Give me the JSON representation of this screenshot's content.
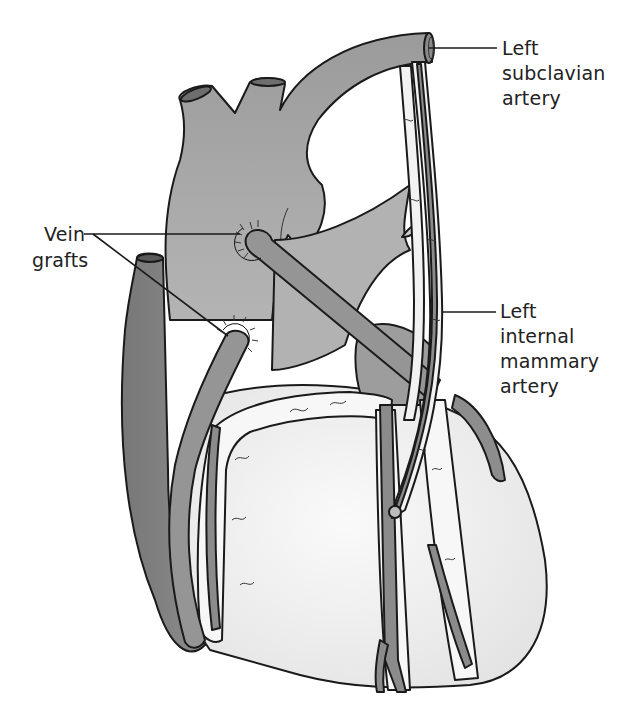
{
  "figure": {
    "labels": {
      "subclavian": [
        "Left",
        "subclavian",
        "artery"
      ],
      "vein_grafts": [
        "Vein",
        "grafts"
      ],
      "mammary": [
        "Left",
        "internal",
        "mammary",
        "artery"
      ]
    },
    "colors": {
      "vessel_dark": "#7d7d7d",
      "vessel_mid": "#9a9a9a",
      "great_vessels": "#a8a8a8",
      "heart_surface": "#efefef",
      "fat_tissue": "#f6f6f6",
      "outline": "#1a1a1a",
      "background": "#ffffff"
    }
  }
}
